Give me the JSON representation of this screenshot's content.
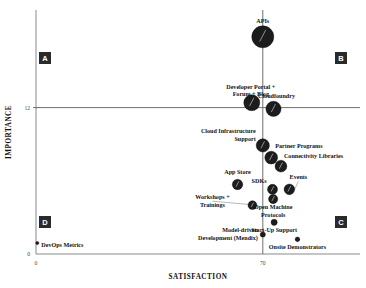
{
  "chart_data": {
    "type": "scatter",
    "title": "",
    "xlabel": "SATISFACTION",
    "ylabel": "IMPORTANCE",
    "xlim": [
      0,
      100
    ],
    "ylim": [
      0,
      20
    ],
    "xticks": [
      "0",
      "70"
    ],
    "yticks": [
      "0",
      "12"
    ],
    "grid": false,
    "legend": "none",
    "threshold_x": 70,
    "threshold_y": 12,
    "quadrants": [
      {
        "letter": "A",
        "position": "top-left"
      },
      {
        "letter": "B",
        "position": "top-right"
      },
      {
        "letter": "C",
        "position": "bottom-right"
      },
      {
        "letter": "D",
        "position": "bottom-left"
      }
    ],
    "points": [
      {
        "label": "APIs",
        "x": 70.0,
        "y": 17.8,
        "size": 11.0,
        "label_dx": 0,
        "label_dy": -14,
        "label_anchor": "middle",
        "label_lines": [
          "APIs"
        ],
        "leader": false
      },
      {
        "label": "Developer Portal + Forum + Blog",
        "x": 66.6,
        "y": 12.4,
        "size": 8.0,
        "label_dx": -1,
        "label_dy": -14,
        "label_anchor": "middle",
        "label_lines": [
          "Developer Portal +",
          "Forum + Blog"
        ],
        "leader": false
      },
      {
        "label": "Cloudfoundry",
        "x": 73.3,
        "y": 11.9,
        "size": 7.6,
        "label_dx": 3,
        "label_dy": -11,
        "label_anchor": "middle",
        "label_lines": [
          "Cloudfoundry"
        ],
        "leader": false
      },
      {
        "label": "Cloud Infrastructure Support",
        "x": 70.0,
        "y": 8.9,
        "size": 6.6,
        "label_dx": -7,
        "label_dy": -12,
        "label_anchor": "end",
        "label_lines": [
          "Cloud Infrastructure",
          "Support"
        ],
        "leader": false
      },
      {
        "label": "Partner Programs",
        "x": 72.6,
        "y": 7.9,
        "size": 6.4,
        "label_dx": 4,
        "label_dy": -10,
        "label_anchor": "start",
        "label_lines": [
          "Partner Programs"
        ],
        "leader": false
      },
      {
        "label": "Connectivity Libraries",
        "x": 75.6,
        "y": 7.2,
        "size": 5.9,
        "label_dx": 3,
        "label_dy": -8,
        "label_anchor": "start",
        "label_lines": [
          "Connectivity Libraries"
        ],
        "leader": false
      },
      {
        "label": "App Store",
        "x": 62.2,
        "y": 5.7,
        "size": 5.2,
        "label_dx": 0,
        "label_dy": -10,
        "label_anchor": "middle",
        "label_lines": [
          "App Store"
        ],
        "leader": false
      },
      {
        "label": "SDKs",
        "x": 73.0,
        "y": 5.3,
        "size": 5.0,
        "label_dx": -6,
        "label_dy": -6,
        "label_anchor": "end",
        "label_lines": [
          "SDKs"
        ],
        "leader": false
      },
      {
        "label": "Events",
        "x": 78.2,
        "y": 5.3,
        "size": 5.3,
        "label_dx": 9,
        "label_dy": -10,
        "label_anchor": "middle",
        "label_lines": [
          "Events"
        ],
        "leader": true
      },
      {
        "label": "Open Machine Protocols",
        "x": 73.2,
        "y": 4.5,
        "size": 4.6,
        "label_dx": 0,
        "label_dy": 10,
        "label_anchor": "middle",
        "label_lines": [
          "Open Machine",
          "Protocols"
        ],
        "leader": false
      },
      {
        "label": "Workshops + Trainings",
        "x": 66.8,
        "y": 4.0,
        "size": 4.4,
        "label_dx": -40,
        "label_dy": -6,
        "label_anchor": "middle",
        "label_lines": [
          "Workshops +",
          "Trainings"
        ],
        "leader": true
      },
      {
        "label": "Start-Up Support",
        "x": 73.5,
        "y": 2.6,
        "size": 3.1,
        "label_dx": 0,
        "label_dy": 10,
        "label_anchor": "middle",
        "label_lines": [
          "Start-Up Support"
        ],
        "leader": false
      },
      {
        "label": "Model-driven Development (Mendix)",
        "x": 70.0,
        "y": 1.6,
        "size": 2.6,
        "label_dx": -5,
        "label_dy": -2,
        "label_anchor": "end",
        "label_lines": [
          "Model-driven",
          "Development (Mendix)"
        ],
        "leader": false
      },
      {
        "label": "Onsite Demonstrators",
        "x": 80.7,
        "y": 1.2,
        "size": 2.3,
        "label_dx": 0,
        "label_dy": 10,
        "label_anchor": "middle",
        "label_lines": [
          "Onsite Demonstrators"
        ],
        "leader": false
      },
      {
        "label": "DevOps Metrics",
        "x": 0.4,
        "y": 0.9,
        "size": 1.6,
        "label_dx": 4,
        "label_dy": 4,
        "label_anchor": "start",
        "label_lines": [
          "DevOps Metrics"
        ],
        "leader": false
      }
    ]
  }
}
